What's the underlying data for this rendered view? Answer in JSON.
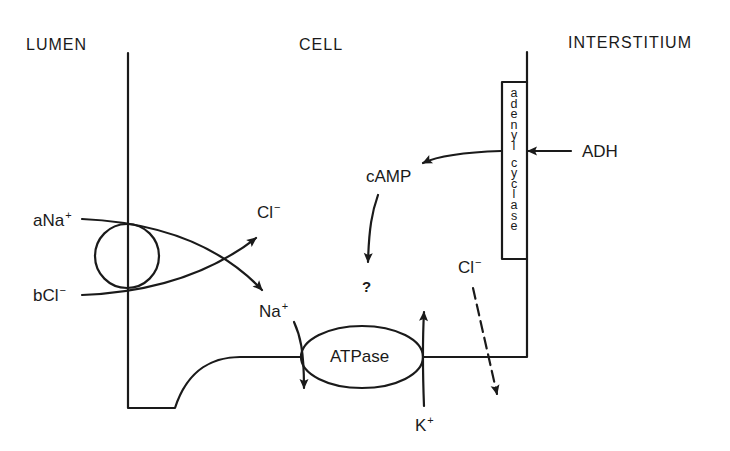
{
  "regions": {
    "lumen": "LUMEN",
    "cell": "CELL",
    "interstitium": "INTERSTITIUM"
  },
  "cotransporter": {
    "na_label": "aNa",
    "na_charge": "+",
    "cl_label": "bCl",
    "cl_charge": "−",
    "cl_out_label": "Cl",
    "cl_out_charge": "−",
    "na_out_label": "Na",
    "na_out_charge": "+"
  },
  "pump": {
    "label": "ATPase",
    "k_label": "K",
    "k_charge": "+"
  },
  "signaling": {
    "hormone": "ADH",
    "enzyme": "adenyl cyclase",
    "enzyme_letters": [
      "a",
      "d",
      "e",
      "n",
      "y",
      "l",
      "",
      "c",
      "y",
      "c",
      "l",
      "a",
      "s",
      "e"
    ],
    "second_messenger": "cAMP",
    "unknown": "?"
  },
  "basolateral": {
    "cl_label": "Cl",
    "cl_charge": "−"
  },
  "colors": {
    "line": "#1a1a1a",
    "background": "#ffffff"
  }
}
